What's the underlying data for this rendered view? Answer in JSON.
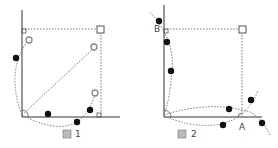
{
  "figures": [
    {
      "caption": "図 1",
      "caption_kanji": "図",
      "caption_num": "1"
    },
    {
      "caption": "図 2",
      "caption_kanji": "図",
      "caption_num": "2",
      "labels": {
        "A": "A",
        "B": "B"
      }
    }
  ],
  "colors": {
    "line": "#333333",
    "dotted": "#777777",
    "filled_point": "#111111",
    "open_point": "#888888"
  }
}
